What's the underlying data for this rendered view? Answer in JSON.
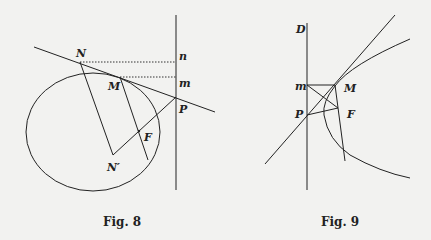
{
  "figures": [
    {
      "id": "fig8",
      "caption": "Fig. 8",
      "labels": {
        "N": "N",
        "n": "n",
        "M": "M",
        "m": "m",
        "P": "P",
        "F": "F",
        "N_prime": "N′"
      }
    },
    {
      "id": "fig9",
      "caption": "Fig. 9",
      "labels": {
        "D": "D",
        "m": "m",
        "M": "M",
        "P": "P",
        "F": "F"
      }
    }
  ],
  "colors": {
    "background": "#f2f2f0",
    "ink": "#222222"
  }
}
